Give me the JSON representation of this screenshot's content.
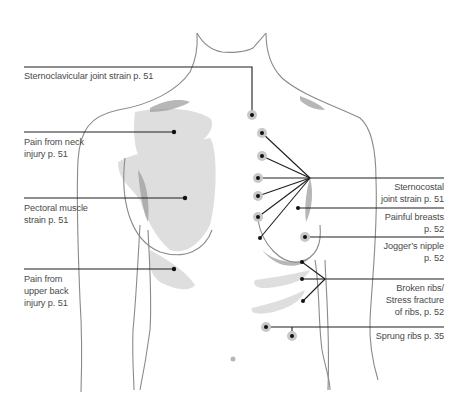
{
  "diagram": {
    "type": "anatomical-callout-diagram",
    "colors": {
      "outline": "#8a8a8a",
      "shade": "#dedede",
      "leader": "#1e1e1e",
      "text": "#4a4a4a",
      "dot_halo": "#c8c8c8"
    },
    "labels": {
      "sternoclavicular": {
        "lines": [
          "Sternoclavicular joint strain p. 51"
        ],
        "page": "51"
      },
      "neck_injury": {
        "lines": [
          "Pain from neck",
          "injury p. 51"
        ],
        "page": "51"
      },
      "pectoral": {
        "lines": [
          "Pectoral muscle",
          "strain p. 51"
        ],
        "page": "51"
      },
      "upper_back": {
        "lines": [
          "Pain from",
          "upper back",
          "injury p. 51"
        ],
        "page": "51"
      },
      "sternocostal": {
        "lines": [
          "Sternocostal",
          "joint strain p. 51"
        ],
        "page": "51"
      },
      "painful_breasts": {
        "lines": [
          "Painful breasts",
          "p. 52"
        ],
        "page": "52"
      },
      "joggers_nipple": {
        "lines": [
          "Jogger’s nipple",
          "p. 52"
        ],
        "page": "52"
      },
      "broken_ribs": {
        "lines": [
          "Broken ribs/",
          "Stress fracture",
          "of ribs, p. 52"
        ],
        "page": "52"
      },
      "sprung_ribs": {
        "lines": [
          "Sprung ribs p. 35"
        ],
        "page": "35"
      }
    }
  }
}
